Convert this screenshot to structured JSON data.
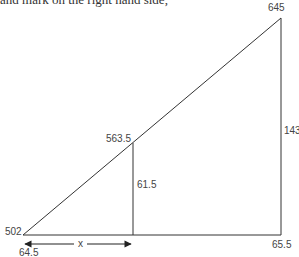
{
  "header": {
    "cut_text": "and mark on the right hand side,"
  },
  "diagram": {
    "type": "similar-triangles",
    "labels": {
      "top_vertex": "645",
      "mid_point": "563.5",
      "mid_height": "61.5",
      "right_height": "143",
      "left_vertex": "502",
      "left_bottom": "64.5",
      "right_bottom": "65.5",
      "distance": "x"
    },
    "colors": {
      "line": "#333333",
      "text": "#444444"
    }
  }
}
